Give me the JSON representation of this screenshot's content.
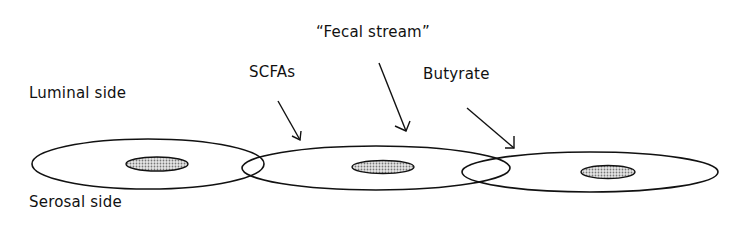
{
  "diagram": {
    "labels": {
      "luminal": "Luminal side",
      "serosal": "Serosal side",
      "scfas": "SCFAs",
      "fecal_stream": "“Fecal stream”",
      "butyrate": "Butyrate"
    },
    "segments": [
      {
        "name": "segment-1",
        "cx": 145,
        "cy": 164,
        "rx": 114,
        "ry": 25,
        "inner_cx": 157,
        "inner_cy": 164
      },
      {
        "name": "segment-2",
        "cx": 376,
        "cy": 168,
        "rx": 134,
        "ry": 22,
        "inner_cx": 383,
        "inner_cy": 167
      },
      {
        "name": "segment-3",
        "cx": 596,
        "cy": 172,
        "rx": 122,
        "ry": 20,
        "inner_cx": 608,
        "inner_cy": 172
      }
    ],
    "colors": {
      "stroke": "#111111",
      "shading": "#bdbdbd"
    }
  }
}
